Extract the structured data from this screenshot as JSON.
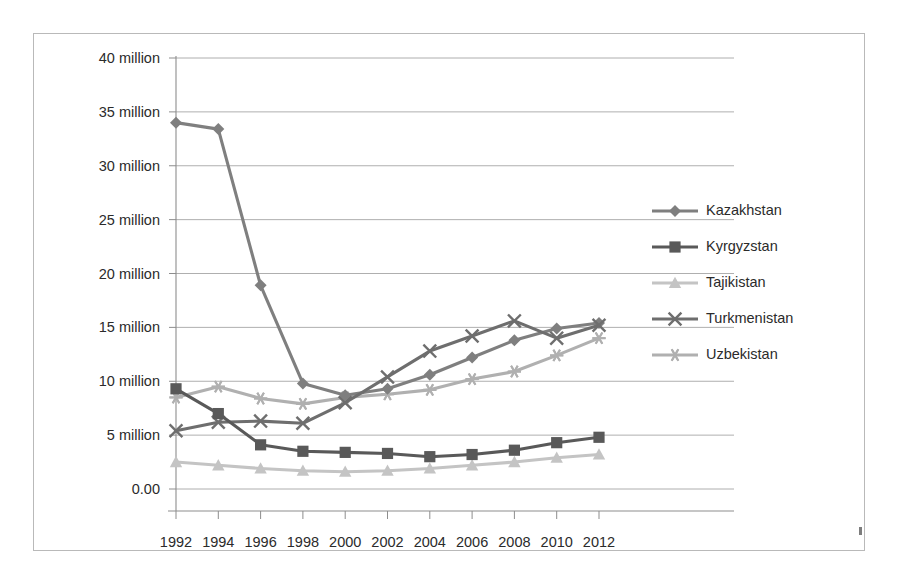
{
  "chart_data": {
    "type": "line",
    "title": "",
    "subtitle": "",
    "xlabel": "",
    "ylabel": "",
    "x": [
      1992,
      1994,
      1996,
      1998,
      2000,
      2002,
      2004,
      2006,
      2008,
      2010,
      2012
    ],
    "categories": [
      "1992",
      "1994",
      "1996",
      "1998",
      "2000",
      "2002",
      "2004",
      "2006",
      "2008",
      "2010",
      "2012"
    ],
    "xtick_labels": [
      "1992",
      "1994",
      "1996",
      "1998",
      "2000",
      "2002",
      "2004",
      "2006",
      "2008",
      "2010",
      "2012"
    ],
    "ytick_labels": [
      "40 million",
      "35 million",
      "30 million",
      "25 million",
      "20 million",
      "15 million",
      "10 million",
      "5 million",
      "0.00"
    ],
    "ytick_values": [
      40,
      35,
      30,
      25,
      20,
      15,
      10,
      5,
      0
    ],
    "ylim": [
      0,
      40
    ],
    "xlim": [
      1992,
      2012
    ],
    "grid": "horizontal",
    "legend_position": "right",
    "units": "million",
    "series": [
      {
        "name": "Kazakhstan",
        "marker": "diamond",
        "color": "#7f7f7f",
        "values": [
          34.0,
          33.4,
          18.9,
          9.8,
          8.7,
          9.3,
          10.6,
          12.2,
          13.8,
          14.9,
          15.4
        ]
      },
      {
        "name": "Kyrgyzstan",
        "marker": "square",
        "color": "#595959",
        "values": [
          9.3,
          7.0,
          4.1,
          3.5,
          3.4,
          3.3,
          3.0,
          3.2,
          3.6,
          4.3,
          4.8
        ]
      },
      {
        "name": "Tajikistan",
        "marker": "triangle",
        "color": "#c4c4c4",
        "values": [
          2.5,
          2.2,
          1.9,
          1.7,
          1.6,
          1.7,
          1.9,
          2.2,
          2.5,
          2.9,
          3.2
        ]
      },
      {
        "name": "Turkmenistan",
        "marker": "cross",
        "color": "#6e6e6e",
        "values": [
          5.4,
          6.2,
          6.3,
          6.1,
          8.0,
          10.4,
          12.8,
          14.2,
          15.6,
          14.0,
          15.2
        ]
      },
      {
        "name": "Uzbekistan",
        "marker": "asterisk",
        "color": "#b0b0b0",
        "values": [
          8.5,
          9.5,
          8.4,
          7.9,
          8.5,
          8.8,
          9.2,
          10.2,
          10.9,
          12.4,
          14.0
        ]
      }
    ]
  },
  "legend": {
    "entries": [
      {
        "label": "Kazakhstan"
      },
      {
        "label": "Kyrgyzstan"
      },
      {
        "label": "Tajikistan"
      },
      {
        "label": "Turkmenistan"
      },
      {
        "label": "Uzbekistan"
      }
    ]
  },
  "colors": {
    "grid": "#9a9a9a",
    "axis": "#8d8d8d",
    "frame_border": "#b9b9b9",
    "text": "#2b2b2b",
    "background": "#ffffff"
  }
}
